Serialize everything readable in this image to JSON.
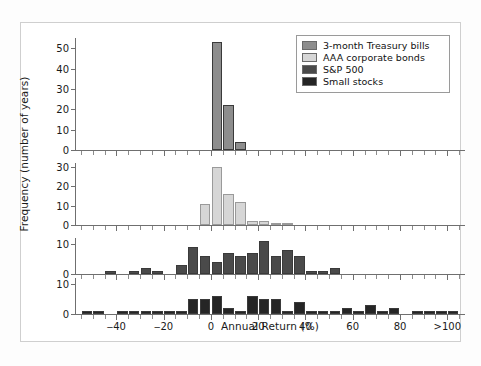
{
  "chart_data": {
    "type": "bar",
    "title": "",
    "subtitle": "",
    "xlabel": "Annual Return (%)",
    "ylabel": "Frequency (number of years)",
    "grid": false,
    "legend_position": "top-right",
    "xlim": [
      -57.5,
      107.5
    ],
    "bin_width": 5,
    "xticks": [
      -40,
      -20,
      0,
      20,
      40,
      60,
      80,
      100
    ],
    "xtick_labels": [
      "‒40",
      "‒20",
      "0",
      "20",
      "40",
      "60",
      "80",
      ">100"
    ],
    "legend": [
      {
        "name": "3-month Treasury bills",
        "color": "#8d8d8d"
      },
      {
        "name": "AAA corporate bonds",
        "color": "#d6d6d6"
      },
      {
        "name": "S&P 500",
        "color": "#4a4a4a"
      },
      {
        "name": "Small stocks",
        "color": "#252525"
      }
    ],
    "panels": [
      {
        "name": "3-month Treasury bills",
        "color": "#8d8d8d",
        "ylim": [
          0,
          55
        ],
        "yticks": [
          0,
          10,
          20,
          30,
          40,
          50
        ],
        "bins": [
          {
            "x": 2.5,
            "value": 53
          },
          {
            "x": 7.5,
            "value": 22
          },
          {
            "x": 12.5,
            "value": 4
          }
        ]
      },
      {
        "name": "AAA corporate bonds",
        "color": "#d6d6d6",
        "ylim": [
          0,
          32
        ],
        "yticks": [
          0,
          10,
          20,
          30
        ],
        "bins": [
          {
            "x": -2.5,
            "value": 11
          },
          {
            "x": 2.5,
            "value": 30
          },
          {
            "x": 7.5,
            "value": 16
          },
          {
            "x": 12.5,
            "value": 12
          },
          {
            "x": 17.5,
            "value": 2
          },
          {
            "x": 22.5,
            "value": 2
          },
          {
            "x": 27.5,
            "value": 1
          },
          {
            "x": 32.5,
            "value": 1
          }
        ]
      },
      {
        "name": "S&P 500",
        "color": "#4a4a4a",
        "ylim": [
          0,
          12
        ],
        "yticks": [
          0,
          10
        ],
        "bins": [
          {
            "x": -42.5,
            "value": 1
          },
          {
            "x": -32.5,
            "value": 1
          },
          {
            "x": -27.5,
            "value": 2
          },
          {
            "x": -22.5,
            "value": 1
          },
          {
            "x": -12.5,
            "value": 3
          },
          {
            "x": -7.5,
            "value": 9
          },
          {
            "x": -2.5,
            "value": 6
          },
          {
            "x": 2.5,
            "value": 4
          },
          {
            "x": 7.5,
            "value": 7
          },
          {
            "x": 12.5,
            "value": 6
          },
          {
            "x": 17.5,
            "value": 7
          },
          {
            "x": 22.5,
            "value": 11
          },
          {
            "x": 27.5,
            "value": 6
          },
          {
            "x": 32.5,
            "value": 8
          },
          {
            "x": 37.5,
            "value": 6
          },
          {
            "x": 42.5,
            "value": 1
          },
          {
            "x": 47.5,
            "value": 1
          },
          {
            "x": 52.5,
            "value": 2
          }
        ]
      },
      {
        "name": "Small stocks",
        "color": "#252525",
        "ylim": [
          0,
          12
        ],
        "yticks": [
          0,
          10
        ],
        "bins": [
          {
            "x": -52.5,
            "value": 1
          },
          {
            "x": -47.5,
            "value": 1
          },
          {
            "x": -37.5,
            "value": 1
          },
          {
            "x": -32.5,
            "value": 1
          },
          {
            "x": -27.5,
            "value": 1
          },
          {
            "x": -22.5,
            "value": 1
          },
          {
            "x": -17.5,
            "value": 1
          },
          {
            "x": -12.5,
            "value": 1
          },
          {
            "x": -7.5,
            "value": 5
          },
          {
            "x": -2.5,
            "value": 5
          },
          {
            "x": 2.5,
            "value": 6
          },
          {
            "x": 7.5,
            "value": 2
          },
          {
            "x": 12.5,
            "value": 1
          },
          {
            "x": 17.5,
            "value": 6
          },
          {
            "x": 22.5,
            "value": 5
          },
          {
            "x": 27.5,
            "value": 5
          },
          {
            "x": 32.5,
            "value": 1
          },
          {
            "x": 37.5,
            "value": 4
          },
          {
            "x": 42.5,
            "value": 1
          },
          {
            "x": 47.5,
            "value": 1
          },
          {
            "x": 52.5,
            "value": 1
          },
          {
            "x": 57.5,
            "value": 2
          },
          {
            "x": 62.5,
            "value": 1
          },
          {
            "x": 67.5,
            "value": 3
          },
          {
            "x": 72.5,
            "value": 1
          },
          {
            "x": 77.5,
            "value": 2
          },
          {
            "x": 87.5,
            "value": 1
          },
          {
            "x": 92.5,
            "value": 1
          },
          {
            "x": 97.5,
            "value": 1
          },
          {
            "x": 102.5,
            "value": 1
          }
        ]
      }
    ]
  }
}
